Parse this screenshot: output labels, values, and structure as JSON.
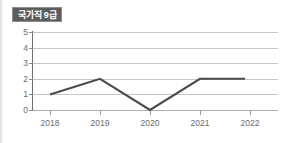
{
  "badge": {
    "label": "국가직 9급"
  },
  "chart_data": {
    "type": "line",
    "title": "국가직 9급",
    "xlabel": "",
    "ylabel": "",
    "categories": [
      "2018",
      "2019",
      "2020",
      "2021",
      "2022"
    ],
    "values": [
      1,
      2,
      0,
      2,
      2
    ],
    "series": [
      {
        "name": "국가직 9급",
        "values": [
          1,
          2,
          0,
          2,
          2
        ],
        "color": "#4a4a4a"
      }
    ],
    "ylim": [
      0,
      5
    ],
    "y_ticks": [
      "0",
      "1",
      "2",
      "3",
      "4",
      "5"
    ],
    "grid": true,
    "legend": "none",
    "line_color": "#4a4a4a",
    "grid_color": "#c6c6c6",
    "axis_color": "#6f6f6f",
    "tick_label_color": "#6b6b6b",
    "badge_bg_color": "#5d5d5d",
    "badge_text_color": "#ffffff",
    "background_color": "#ffffff",
    "markers": false
  }
}
